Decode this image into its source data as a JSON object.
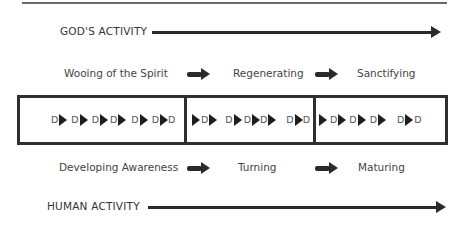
{
  "diagram": {
    "top_axis": {
      "label": "GOD'S ACTIVITY"
    },
    "bottom_axis": {
      "label": "HUMAN ACTIVITY"
    },
    "god_stages": [
      "Wooing of the Spirit",
      "Regenerating",
      "Sanctifying"
    ],
    "human_stages": [
      "Developing Awareness",
      "Turning",
      "Maturing"
    ],
    "decision_symbol": "D",
    "sections": [
      {
        "name": "section-1",
        "pattern": "D ▶ D ▶ D ▶ D ▶ D ▶ D ▶ D"
      },
      {
        "name": "section-2",
        "pattern": "▶ D ▶ D ▶ D ▶ D ▶ D ▶ D"
      },
      {
        "name": "section-3",
        "pattern": "▶ D ▶ D ▶ D ▶ D ▶ D"
      }
    ],
    "colors": {
      "ink": "#2a2a2a",
      "text": "#444444",
      "background": "#ffffff"
    }
  }
}
